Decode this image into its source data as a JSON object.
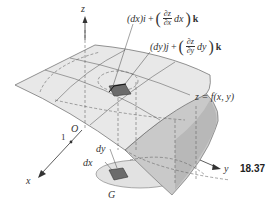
{
  "figure": {
    "number": "18.37"
  },
  "axes": {
    "x_label": "x",
    "y_label": "y",
    "z_label": "z",
    "origin_label": "O",
    "unit_mark": "1"
  },
  "labels": {
    "surface_equation": "z = f(x, y)",
    "region": "G",
    "dx": "dx",
    "dy": "dy"
  },
  "vectors": {
    "vector_x": {
      "lead": "(dx)i",
      "plus": "+",
      "num": "∂z",
      "den": "∂x",
      "trail": "dx",
      "unit": "k"
    },
    "vector_y": {
      "lead": "(dy)j",
      "plus": "+",
      "num": "∂z",
      "den": "∂y",
      "trail": "dy",
      "unit": "k"
    }
  },
  "colors": {
    "surface_fill": "#e6e6e6",
    "surface_dark": "#c4c4c4",
    "patch": "#6b6b6b",
    "line": "#555555"
  }
}
